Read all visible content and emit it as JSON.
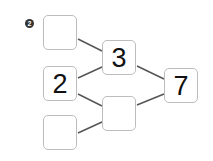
{
  "problem": {
    "number_label": "2",
    "boxes": [
      {
        "id": "top-left",
        "value": ""
      },
      {
        "id": "middle-left",
        "value": "2"
      },
      {
        "id": "bottom-left",
        "value": ""
      },
      {
        "id": "top-middle",
        "value": "3"
      },
      {
        "id": "bottom-middle",
        "value": ""
      },
      {
        "id": "right",
        "value": "7"
      }
    ]
  },
  "colors": {
    "line": "#555555",
    "box_border": "#bdbdbd",
    "badge": "#333333"
  }
}
